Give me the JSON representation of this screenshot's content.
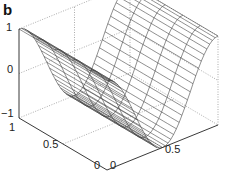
{
  "panel": {
    "label": "b"
  },
  "chart_data": {
    "type": "surface",
    "style": "mesh",
    "title": "",
    "x": {
      "label": "",
      "range": [
        0,
        1
      ],
      "ticks": [
        "0",
        "0.5"
      ]
    },
    "y": {
      "label": "",
      "range": [
        0,
        1
      ],
      "ticks": [
        "1",
        "0.5",
        "0"
      ]
    },
    "z": {
      "label": "",
      "range": [
        -1,
        1
      ],
      "ticks": [
        "1",
        "0",
        "-1"
      ]
    },
    "samples_x": [
      0,
      0.125,
      0.25,
      0.375,
      0.5,
      0.625,
      0.75,
      0.875,
      1
    ],
    "samples_z": [
      1,
      0.707,
      0,
      -0.707,
      -1,
      -0.707,
      0,
      0.707,
      1
    ],
    "grid": "dotted box",
    "line_color": "#333333"
  },
  "axes": {
    "z_ticks": [
      {
        "label": "1",
        "x": 6,
        "y": 22
      },
      {
        "label": "0",
        "x": 7,
        "y": 64
      },
      {
        "label": "−1",
        "x": 1,
        "y": 108
      }
    ],
    "y_ticks": [
      {
        "label": "1",
        "x": 9,
        "y": 122
      },
      {
        "label": "0.5",
        "x": 43,
        "y": 139
      },
      {
        "label": "0",
        "x": 94,
        "y": 160
      }
    ],
    "x_ticks": [
      {
        "label": "0",
        "x": 110,
        "y": 160
      },
      {
        "label": "0.5",
        "x": 165,
        "y": 144
      }
    ]
  }
}
